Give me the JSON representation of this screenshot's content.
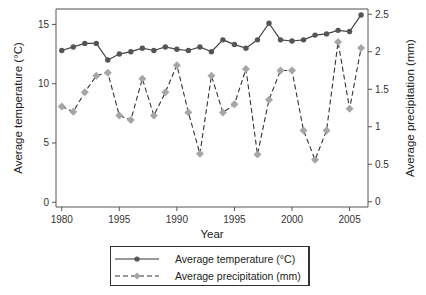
{
  "chart_data": {
    "type": "line",
    "title": "",
    "xlabel": "Year",
    "ylabel": "Average temperature (°C)",
    "y2label": "Average precipitation (mm)",
    "x": [
      1980,
      1981,
      1982,
      1983,
      1984,
      1985,
      1986,
      1987,
      1988,
      1989,
      1990,
      1991,
      1992,
      1993,
      1994,
      1995,
      1996,
      1997,
      1998,
      1999,
      2000,
      2001,
      2002,
      2003,
      2004,
      2005,
      2006
    ],
    "x_tick_labels": [
      "1980",
      "1995",
      "1990",
      "1995",
      "2000",
      "2005"
    ],
    "x_tick_positions": [
      1980,
      1985,
      1990,
      1995,
      2000,
      2005
    ],
    "xlim": [
      1979.5,
      2006.6
    ],
    "ylim": [
      -0.4,
      16.3
    ],
    "y_ticks": [
      0,
      5,
      10,
      15
    ],
    "y2lim": [
      -0.07,
      2.57
    ],
    "y2_ticks": [
      0,
      0.5,
      1,
      1.5,
      2,
      2.5
    ],
    "y2_tick_labels": [
      "0",
      "0.5",
      "1",
      "1.5",
      "2",
      "2.5"
    ],
    "grid": false,
    "legend_position": "bottom",
    "series": [
      {
        "name": "Average temperature (°C)",
        "axis": "left",
        "style": "solid",
        "marker": "circle",
        "color": "#555555",
        "values": [
          12.8,
          13.1,
          13.4,
          13.4,
          12.0,
          12.5,
          12.7,
          13.0,
          12.8,
          13.1,
          12.9,
          12.8,
          13.1,
          12.7,
          13.7,
          13.3,
          13.0,
          13.7,
          15.1,
          13.7,
          13.6,
          13.7,
          14.1,
          14.2,
          14.5,
          14.4,
          15.8
        ]
      },
      {
        "name": "Average precipitation (mm)",
        "axis": "right",
        "style": "dashed",
        "marker": "diamond",
        "color": "#a6a6a6",
        "line_color": "#333333",
        "values": [
          1.27,
          1.2,
          1.46,
          1.68,
          1.72,
          1.15,
          1.09,
          1.64,
          1.15,
          1.46,
          1.82,
          1.19,
          0.64,
          1.68,
          1.19,
          1.3,
          1.77,
          0.63,
          1.36,
          1.75,
          1.75,
          0.95,
          0.56,
          0.95,
          2.13,
          1.24,
          2.05
        ]
      }
    ]
  },
  "legend": {
    "items": [
      {
        "label": "Average temperature (°C)"
      },
      {
        "label": "Average precipitation (mm)"
      }
    ]
  }
}
